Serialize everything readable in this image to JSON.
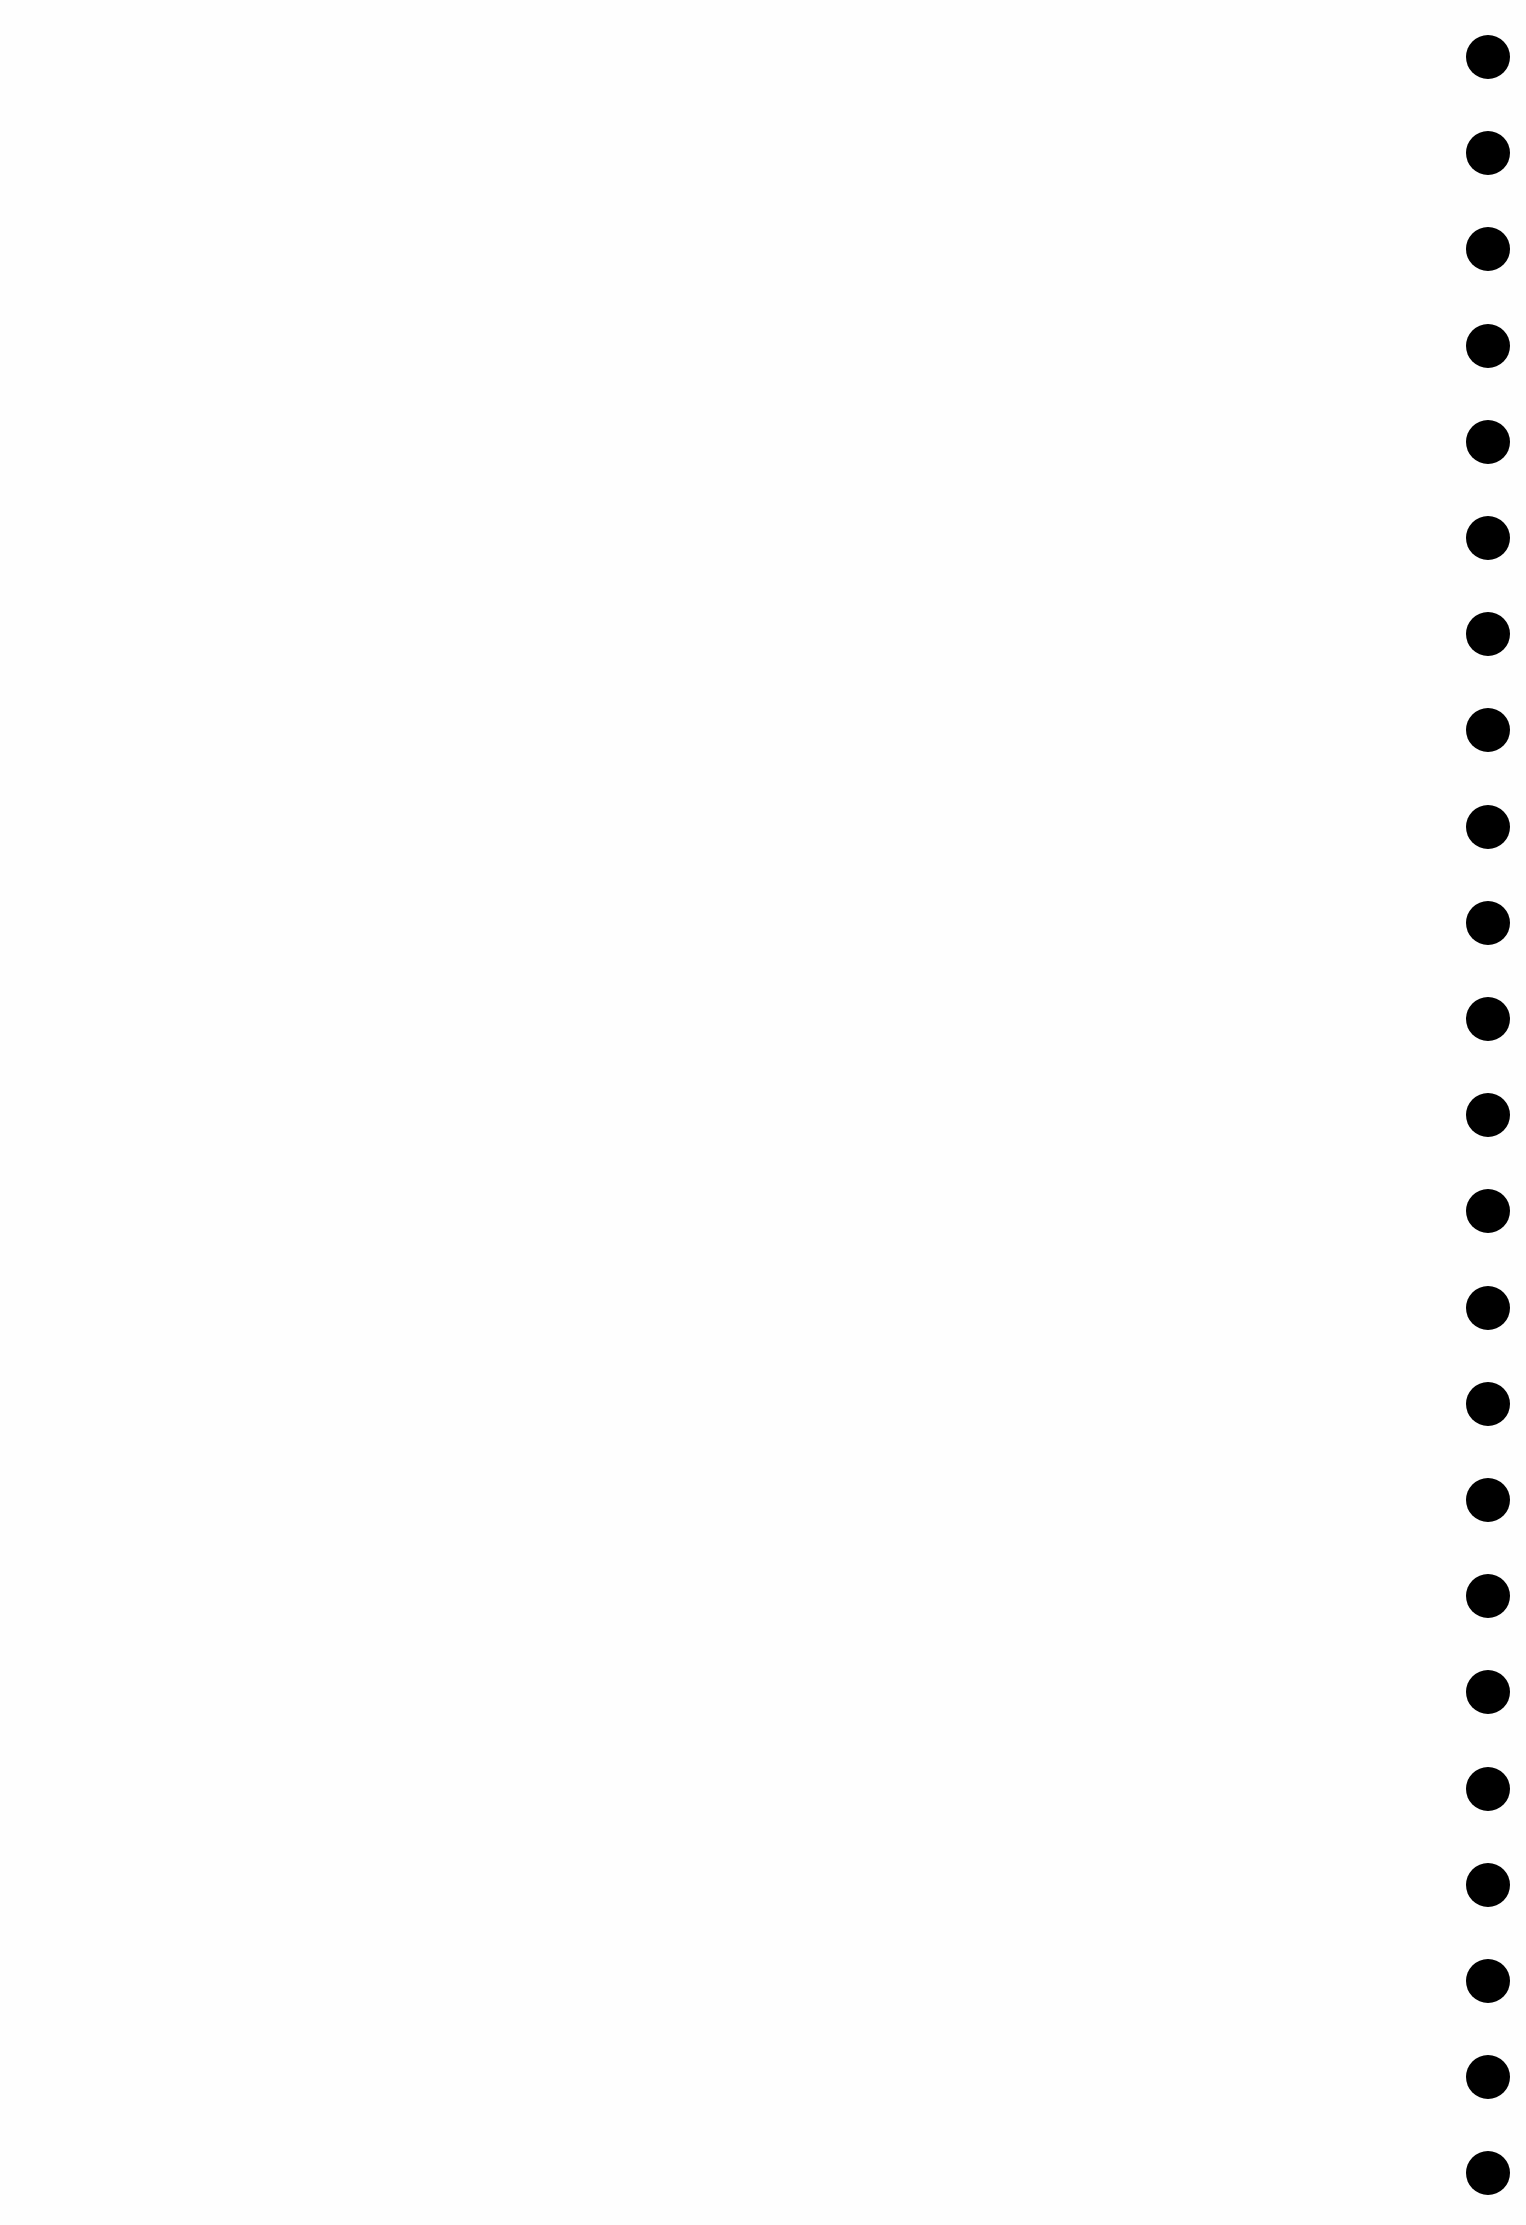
{
  "page": {
    "background": "#fefefe",
    "width": 1526,
    "height": 2225
  },
  "punch_holes": {
    "count": 23,
    "color": "#000000",
    "center_x": 1488,
    "first_center_y": 57,
    "spacing_y": 96.2,
    "diameter": 44
  }
}
